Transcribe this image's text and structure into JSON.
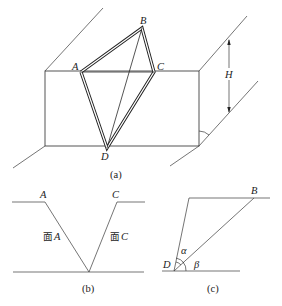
{
  "figure_a": {
    "caption": "(a)",
    "points": {
      "A": "A",
      "B": "B",
      "C": "C",
      "D": "D"
    },
    "height_label": "H"
  },
  "figure_b": {
    "caption": "(b)",
    "left_label": "A",
    "right_label": "C",
    "face_a_prefix": "面",
    "face_a_letter": "A",
    "face_c_prefix": "面",
    "face_c_letter": "C"
  },
  "figure_c": {
    "caption": "(c)",
    "point_b": "B",
    "point_d": "D",
    "angle_alpha": "α",
    "angle_beta": "β"
  }
}
